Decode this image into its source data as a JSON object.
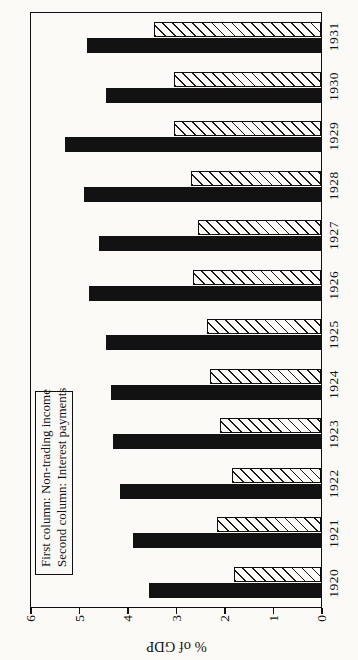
{
  "colors": {
    "paper": "#fbfaf6",
    "ink": "#0f0f0f",
    "bar_solid_fill": "#121212",
    "hatch_line": "#1a1a1a"
  },
  "chart_data": {
    "type": "bar",
    "note_layout": "grouped vertical bar chart rendered landscape, whole figure rotated 90deg counter-clockwise on the page",
    "title": "",
    "xlabel": "",
    "ylabel": "% of GDP",
    "ylim": [
      0,
      6
    ],
    "yticks": [
      0,
      1,
      2,
      3,
      4,
      5,
      6
    ],
    "grid": false,
    "legend_position": "top-left-inside",
    "legend": {
      "line1": "First column: Non-trading income",
      "line2": "Second column: Interest payments"
    },
    "categories": [
      "1920",
      "1921",
      "1922",
      "1923",
      "1924",
      "1925",
      "1926",
      "1927",
      "1928",
      "1929",
      "1930",
      "1931"
    ],
    "series": [
      {
        "name": "Non-trading income",
        "style": "solid-black",
        "values": [
          3.55,
          3.9,
          4.15,
          4.3,
          4.35,
          4.45,
          4.8,
          4.6,
          4.9,
          5.3,
          4.45,
          4.85
        ]
      },
      {
        "name": "Interest payments",
        "style": "hatched-diagonal",
        "values": [
          1.8,
          2.15,
          1.85,
          2.1,
          2.3,
          2.35,
          2.65,
          2.55,
          2.7,
          3.05,
          3.05,
          3.45
        ]
      }
    ]
  }
}
